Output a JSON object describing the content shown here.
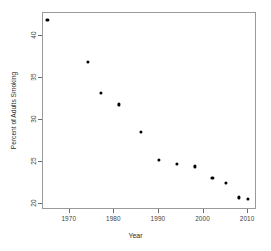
{
  "chart_data": {
    "type": "scatter",
    "title": "",
    "xlabel": "Year",
    "ylabel": "Percent of Adults Smoking",
    "xlim": [
      1964,
      2012
    ],
    "ylim": [
      19.3,
      42.8
    ],
    "grid": false,
    "legend": null,
    "xticks": [
      1970,
      1980,
      1990,
      2000,
      2010
    ],
    "xtick_labels": [
      "1970",
      "1980",
      "1990",
      "2000",
      "2010"
    ],
    "yticks": [
      20,
      25,
      30,
      35,
      40
    ],
    "ytick_labels": [
      "20",
      "25",
      "30",
      "35",
      "40"
    ],
    "marker": "filled-square",
    "marker_color": "#000000",
    "x": [
      1965,
      1974,
      1977,
      1981,
      1986,
      1990,
      1994,
      1998,
      2002,
      2005,
      2008,
      2010
    ],
    "y": [
      42.0,
      37.0,
      33.3,
      31.9,
      28.6,
      25.3,
      24.8,
      24.5,
      23.1,
      22.5,
      20.8,
      20.6
    ],
    "points": [
      {
        "year": 1965,
        "percent": 42.0
      },
      {
        "year": 1974,
        "percent": 37.0
      },
      {
        "year": 1977,
        "percent": 33.3
      },
      {
        "year": 1981,
        "percent": 31.9
      },
      {
        "year": 1986,
        "percent": 28.6
      },
      {
        "year": 1990,
        "percent": 25.3
      },
      {
        "year": 1994,
        "percent": 24.8
      },
      {
        "year": 1998,
        "percent": 24.5
      },
      {
        "year": 2002,
        "percent": 23.1
      },
      {
        "year": 2005,
        "percent": 22.5
      },
      {
        "year": 2008,
        "percent": 20.8
      },
      {
        "year": 2010,
        "percent": 20.6
      }
    ]
  },
  "colors": {
    "background": "#ffffff",
    "axis": "#9a9a9a",
    "tick": "#6f6f6f",
    "text": "#2b2b2b",
    "marker": "#000000"
  }
}
